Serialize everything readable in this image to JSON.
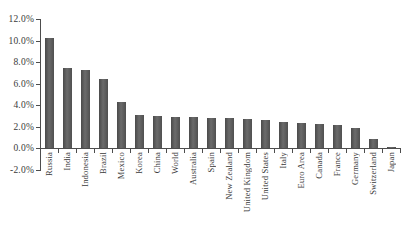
{
  "figure": {
    "background": "#ffffff",
    "text_color": "#3a3a3a",
    "axis_color": "#4d4d4d",
    "bar_color": "#565656"
  },
  "chart_data": {
    "type": "bar",
    "title": "",
    "xlabel": "",
    "ylabel": "",
    "unit": "%",
    "grid": false,
    "legend": null,
    "ylim": [
      -2,
      12
    ],
    "ytick_step": 2,
    "ytick_labels": [
      "12.0%",
      "10.0%",
      "8.0%",
      "6.0%",
      "4.0%",
      "2.0%",
      "0.0%",
      "-2.0%"
    ],
    "ytick_values": [
      12,
      10,
      8,
      6,
      4,
      2,
      0,
      -2
    ],
    "categories": [
      "Russia",
      "India",
      "Indonesia",
      "Brazil",
      "Mexico",
      "Korea",
      "China",
      "World",
      "Australia",
      "Spain",
      "New Zealand",
      "United Kingdom",
      "United States",
      "Italy",
      "Euro Area",
      "Canada",
      "France",
      "Germany",
      "Switzerland",
      "Japan"
    ],
    "values": [
      10.2,
      7.4,
      7.3,
      6.4,
      4.3,
      3.1,
      3.0,
      2.9,
      2.9,
      2.8,
      2.8,
      2.7,
      2.6,
      2.4,
      2.3,
      2.2,
      2.1,
      1.9,
      0.8,
      0.1
    ]
  }
}
